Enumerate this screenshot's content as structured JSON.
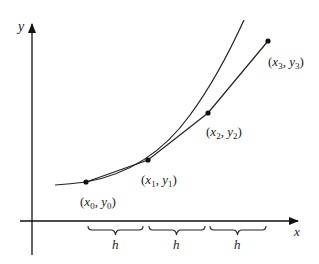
{
  "diagram": {
    "type": "numerical-method-illustration",
    "axes": {
      "x_label": "x",
      "y_label": "y"
    },
    "curve": {
      "description": "exact solution curve (convex, increasing)"
    },
    "points": [
      {
        "name": "P0",
        "label": "(x0, y0)",
        "var_x": "x",
        "sub_x": "0",
        "var_y": "y",
        "sub_y": "0"
      },
      {
        "name": "P1",
        "label": "(x1, y1)",
        "var_x": "x",
        "sub_x": "1",
        "var_y": "y",
        "sub_y": "1"
      },
      {
        "name": "P2",
        "label": "(x2, y2)",
        "var_x": "x",
        "sub_x": "2",
        "var_y": "y",
        "sub_y": "2"
      },
      {
        "name": "P3",
        "label": "(x3, y3)",
        "var_x": "x",
        "sub_x": "3",
        "var_y": "y",
        "sub_y": "3"
      }
    ],
    "step_braces": [
      {
        "label": "h"
      },
      {
        "label": "h"
      },
      {
        "label": "h"
      }
    ],
    "colors": {
      "stroke": "#222222",
      "background": "#ffffff"
    }
  }
}
